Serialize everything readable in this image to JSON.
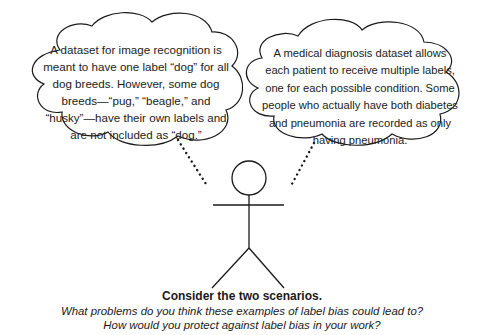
{
  "scenarios": {
    "left": {
      "text": "A dataset for image recognition is meant to have one label “dog” for all dog breeds. However, some dog breeds—“pug,” “beagle,” and “husky”—have their own labels and are not included as “dog.”"
    },
    "right": {
      "text": "A medical diagnosis dataset allows each patient to receive multiple labels, one for each possible condition. Some people who actually have both diabetes and pneumonia are recorded as only having pneumonia."
    }
  },
  "figure": {
    "icon": "stick-figure-icon"
  },
  "caption": {
    "title": "Consider the two scenarios.",
    "question1": "What problems do you think these examples of label bias could lead to?",
    "question2": "How would you protect against label bias in your work?"
  },
  "colors": {
    "stroke": "#1a1a1a",
    "background": "#ffffff"
  }
}
